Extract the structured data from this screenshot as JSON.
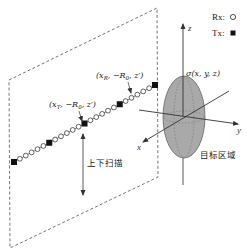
{
  "legend": {
    "rx_label": "Rx:",
    "tx_label": "Tx:",
    "rx_symbol": "open-circle",
    "tx_symbol": "filled-square"
  },
  "axes": {
    "x_label": "x",
    "y_label": "y",
    "z_label": "z"
  },
  "target": {
    "sigma_label": "σ(x, y, z)",
    "region_label": "目标区域",
    "fill_color": "#a9a9a9"
  },
  "array": {
    "tx_label": "(x",
    "tx_sub": "T",
    "tx_rest": ", −R",
    "tx_sub2": "0",
    "tx_end": ", z′)",
    "rx_label": "(x",
    "rx_sub": "R",
    "rx_rest": ", −R",
    "rx_sub2": "0",
    "rx_end": ", z′)",
    "tx_count": 5,
    "rx_per_gap": 5
  },
  "scan": {
    "label": "上下扫描"
  },
  "colors": {
    "line": "#333333",
    "dashed": "#555555",
    "ellipse_fill": "#a9a9a9"
  }
}
